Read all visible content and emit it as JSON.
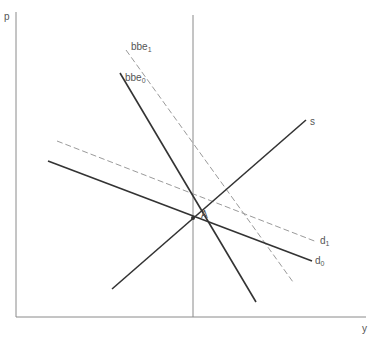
{
  "diagram": {
    "axes": {
      "y_label": "p",
      "x_label": "y"
    },
    "curves": [
      {
        "id": "bbe0",
        "base": "bbe",
        "sub": "0",
        "style": "solid"
      },
      {
        "id": "bbe1",
        "base": "bbe",
        "sub": "1",
        "style": "dashed"
      },
      {
        "id": "s",
        "base": "s",
        "sub": "",
        "style": "solid"
      },
      {
        "id": "d0",
        "base": "d",
        "sub": "0",
        "style": "solid"
      },
      {
        "id": "d1",
        "base": "d",
        "sub": "1",
        "style": "dashed"
      }
    ],
    "point": {
      "label": "A"
    },
    "colors": {
      "solid_line": "#333333",
      "dashed_line": "#9a9a9a",
      "axis": "#8a8a8a",
      "label": "#555555"
    }
  }
}
